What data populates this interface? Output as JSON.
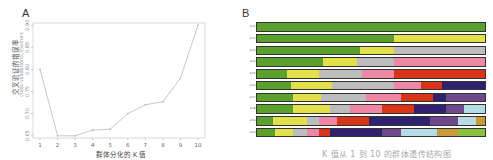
{
  "panels": {
    "a_label": "A",
    "b_label": "B"
  },
  "chart_data": [
    {
      "type": "line",
      "panel": "A",
      "title": "",
      "xlabel": "群体分化的 K 值",
      "ylabel": "交叉验证的错误率",
      "ylabel_en": "cross-validation(CV)errors",
      "x": [
        1,
        2,
        3,
        4,
        5,
        6,
        7,
        8,
        9,
        10
      ],
      "values": [
        0.8,
        0.65,
        0.65,
        0.663,
        0.665,
        0.7,
        0.72,
        0.727,
        0.78,
        0.9
      ],
      "xticks": [
        "1",
        "2",
        "3",
        "4",
        "5",
        "6",
        "7",
        "8",
        "9",
        "10"
      ],
      "yticks": [
        "0.65",
        "0.70",
        "0.75",
        "0.80",
        "0.85",
        "0.90"
      ],
      "ylim": [
        0.645,
        0.905
      ],
      "grid": false,
      "line_color": "#c8c8c8"
    },
    {
      "type": "bar",
      "panel": "B",
      "subtype": "stacked-admixture",
      "categories": [
        "K=1",
        "K=2",
        "K=3",
        "K=4",
        "K=5",
        "K=6",
        "K=7",
        "K=8",
        "K=9",
        "K=10"
      ],
      "row_labels": [
        "K=1",
        "K=2",
        "K=3",
        "K=4",
        "K=5",
        "K=6",
        "K=7",
        "K=8",
        "K=9",
        "K=10"
      ],
      "series_colors": {
        "green": "#5aa02c",
        "yellow": "#e3e04a",
        "gray": "#bdbdbd",
        "pink": "#ee86a5",
        "red": "#d9331a",
        "navy": "#2f2170",
        "purple": "#6e4a8c",
        "lightblue": "#b7dbe5",
        "tan": "#c79a3a",
        "lime": "#89c140"
      },
      "rows": [
        [
          [
            "green",
            100
          ]
        ],
        [
          [
            "green",
            60
          ],
          [
            "yellow",
            40
          ]
        ],
        [
          [
            "green",
            45
          ],
          [
            "yellow",
            15
          ],
          [
            "gray",
            40
          ]
        ],
        [
          [
            "green",
            29
          ],
          [
            "yellow",
            15
          ],
          [
            "gray",
            16
          ],
          [
            "pink",
            40
          ]
        ],
        [
          [
            "green",
            13
          ],
          [
            "yellow",
            14
          ],
          [
            "gray",
            19
          ],
          [
            "pink",
            14
          ],
          [
            "red",
            40
          ]
        ],
        [
          [
            "green",
            15
          ],
          [
            "yellow",
            18
          ],
          [
            "gray",
            27
          ],
          [
            "pink",
            12
          ],
          [
            "red",
            9
          ],
          [
            "navy",
            19
          ]
        ],
        [
          [
            "green",
            16
          ],
          [
            "yellow",
            12
          ],
          [
            "gray",
            20
          ],
          [
            "pink",
            15
          ],
          [
            "red",
            14
          ],
          [
            "navy",
            6
          ],
          [
            "purple",
            17
          ]
        ],
        [
          [
            "green",
            16
          ],
          [
            "yellow",
            16
          ],
          [
            "gray",
            9
          ],
          [
            "pink",
            14
          ],
          [
            "red",
            14
          ],
          [
            "navy",
            14
          ],
          [
            "purple",
            8
          ],
          [
            "lightblue",
            9
          ]
        ],
        [
          [
            "green",
            7
          ],
          [
            "yellow",
            15
          ],
          [
            "gray",
            5
          ],
          [
            "pink",
            8
          ],
          [
            "red",
            14
          ],
          [
            "navy",
            27
          ],
          [
            "purple",
            12
          ],
          [
            "lightblue",
            8
          ],
          [
            "tan",
            4
          ]
        ],
        [
          [
            "green",
            8
          ],
          [
            "yellow",
            8
          ],
          [
            "gray",
            6
          ],
          [
            "pink",
            5
          ],
          [
            "red",
            5
          ],
          [
            "navy",
            23
          ],
          [
            "purple",
            8
          ],
          [
            "lightblue",
            16
          ],
          [
            "tan",
            9
          ],
          [
            "lime",
            12
          ]
        ]
      ]
    }
  ],
  "caption": "K 值从 1 到 10 的群体遗传结构图"
}
